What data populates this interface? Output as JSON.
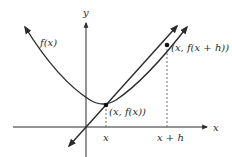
{
  "diagram": {
    "axes": {
      "x_label": "x",
      "y_label": "y"
    },
    "curve": {
      "label": "f(x)"
    },
    "points": [
      {
        "label": "(x, f(x))",
        "tick_label": "x"
      },
      {
        "label": "(x, f(x + h))",
        "tick_label": "x + h"
      }
    ],
    "colors": {
      "stroke": "#2b2b2b",
      "dashed": "#6e6e6e",
      "background": "#ffffff"
    }
  }
}
